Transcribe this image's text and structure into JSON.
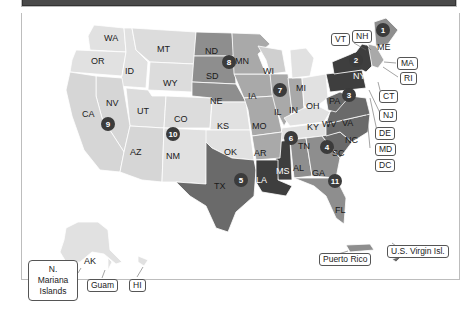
{
  "map": {
    "title": "",
    "colors": {
      "region_lightest": "#e1e1e1",
      "region_light": "#cfcfcf",
      "region_mid": "#a9a9a9",
      "region_midDark": "#8e8e8e",
      "region_dark": "#6a6a6a",
      "region_darkest": "#3e3e3e",
      "badge": "#3b3b3b"
    },
    "states": [
      {
        "abbr": "WA"
      },
      {
        "abbr": "OR"
      },
      {
        "abbr": "ID"
      },
      {
        "abbr": "MT"
      },
      {
        "abbr": "WY"
      },
      {
        "abbr": "CA"
      },
      {
        "abbr": "NV"
      },
      {
        "abbr": "UT"
      },
      {
        "abbr": "AZ"
      },
      {
        "abbr": "CO"
      },
      {
        "abbr": "NM"
      },
      {
        "abbr": "ND"
      },
      {
        "abbr": "SD"
      },
      {
        "abbr": "NE"
      },
      {
        "abbr": "KS"
      },
      {
        "abbr": "OK"
      },
      {
        "abbr": "TX"
      },
      {
        "abbr": "MN"
      },
      {
        "abbr": "IA"
      },
      {
        "abbr": "MO"
      },
      {
        "abbr": "AR"
      },
      {
        "abbr": "LA"
      },
      {
        "abbr": "WI"
      },
      {
        "abbr": "IL"
      },
      {
        "abbr": "MI"
      },
      {
        "abbr": "IN"
      },
      {
        "abbr": "OH"
      },
      {
        "abbr": "KY"
      },
      {
        "abbr": "TN"
      },
      {
        "abbr": "MS"
      },
      {
        "abbr": "AL"
      },
      {
        "abbr": "GA"
      },
      {
        "abbr": "FL"
      },
      {
        "abbr": "SC"
      },
      {
        "abbr": "NC"
      },
      {
        "abbr": "VA"
      },
      {
        "abbr": "WV"
      },
      {
        "abbr": "PA"
      },
      {
        "abbr": "NY"
      },
      {
        "abbr": "ME"
      },
      {
        "abbr": "AK"
      }
    ],
    "region_badges": [
      "1",
      "2",
      "3",
      "4",
      "5",
      "6",
      "7",
      "8",
      "9",
      "10",
      "11"
    ],
    "callouts": {
      "vt": "VT",
      "nh": "NH",
      "ma": "MA",
      "ri": "RI",
      "ct": "CT",
      "nj": "NJ",
      "de": "DE",
      "md": "MD",
      "dc": "DC",
      "puerto_rico": "Puerto Rico",
      "usvi": "U.S. Virgin Isl.",
      "nmi": "N. Mariana Islands",
      "guam": "Guam",
      "hi": "HI"
    }
  }
}
